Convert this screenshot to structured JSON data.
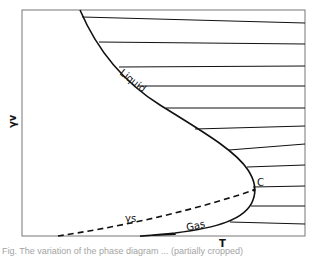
{
  "figure": {
    "type": "phase-diagram",
    "xlabel": "T",
    "ylabel": "γv",
    "curve_labels": {
      "liquid": "Liquid",
      "gas": "Gas",
      "critical_point": "C",
      "dashed_curve": "γs"
    },
    "tie_line_count": 12,
    "colors": {
      "line": "#111111",
      "frame": "#777777",
      "background": "#ffffff"
    }
  },
  "caption": {
    "text": "Fig. The variation of the phase diagram ... (partially cropped)"
  }
}
